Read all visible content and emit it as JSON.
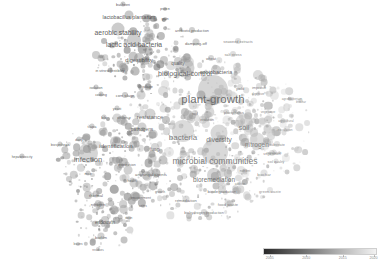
{
  "chart_data": {
    "type": "scatter",
    "title": "",
    "subtitle": "",
    "xlabel": "",
    "ylabel": "",
    "background": "#ffffff",
    "grid": false,
    "legend_position": "bottom-right",
    "overlay": {
      "kind": "colorbar",
      "scale": "grayscale",
      "dark_color": "#2a2a2a",
      "light_color": "#f2f2f2",
      "ticks": [
        "2005",
        "2010",
        "2015",
        "2020"
      ],
      "tick_positions_pct": [
        6,
        38,
        70,
        97
      ],
      "range_min": "2005",
      "range_max": "2020"
    },
    "items": [
      {
        "label": "plant-growth",
        "x": 213,
        "y": 100,
        "size": 30,
        "fs": 11.5,
        "shade": 0.5,
        "weight": 1.0
      },
      {
        "label": "microbial communities",
        "x": 215,
        "y": 161,
        "size": 26,
        "fs": 8.6,
        "shade": 0.46,
        "weight": 0.82
      },
      {
        "label": "bacteria",
        "x": 183,
        "y": 138,
        "size": 22,
        "fs": 8.0,
        "shade": 0.44,
        "weight": 0.78
      },
      {
        "label": "biological-control",
        "x": 185,
        "y": 74,
        "size": 19,
        "fs": 7.2,
        "shade": 0.55,
        "weight": 0.7
      },
      {
        "label": "diversity",
        "x": 219,
        "y": 139,
        "size": 17,
        "fs": 7.0,
        "shade": 0.48,
        "weight": 0.68
      },
      {
        "label": "soil",
        "x": 244,
        "y": 128,
        "size": 17,
        "fs": 7.2,
        "shade": 0.42,
        "weight": 0.68
      },
      {
        "label": "nitrogen",
        "x": 257,
        "y": 145,
        "size": 15,
        "fs": 6.6,
        "shade": 0.4,
        "weight": 0.64
      },
      {
        "label": "infection",
        "x": 88,
        "y": 160,
        "size": 20,
        "fs": 7.6,
        "shade": 0.52,
        "weight": 0.72
      },
      {
        "label": "lactic acid bacteria",
        "x": 134,
        "y": 45,
        "size": 14,
        "fs": 6.8,
        "shade": 0.6,
        "weight": 0.64
      },
      {
        "label": "aerobic stability",
        "x": 118,
        "y": 33,
        "size": 13,
        "fs": 6.8,
        "shade": 0.62,
        "weight": 0.62
      },
      {
        "label": "bioremediation",
        "x": 214,
        "y": 180,
        "size": 14,
        "fs": 6.4,
        "shade": 0.5,
        "weight": 0.6
      },
      {
        "label": "identification",
        "x": 116,
        "y": 146,
        "size": 12,
        "fs": 6.0,
        "shade": 0.58,
        "weight": 0.56
      },
      {
        "label": "lactobacillus plantarum",
        "x": 129,
        "y": 18,
        "size": 9,
        "fs": 5.2,
        "shade": 0.66,
        "weight": 0.46
      },
      {
        "label": "resistance",
        "x": 150,
        "y": 118,
        "size": 11,
        "fs": 5.8,
        "shade": 0.54,
        "weight": 0.52
      },
      {
        "label": "digestibility",
        "x": 139,
        "y": 61,
        "size": 10,
        "fs": 5.6,
        "shade": 0.64,
        "weight": 0.5
      },
      {
        "label": "azotobacteria",
        "x": 216,
        "y": 73,
        "size": 10,
        "fs": 5.4,
        "shade": 0.58,
        "weight": 0.48
      },
      {
        "label": "quality",
        "x": 178,
        "y": 64,
        "size": 8,
        "fs": 4.6,
        "shade": 0.56,
        "weight": 0.42
      },
      {
        "label": "pathogens",
        "x": 142,
        "y": 130,
        "size": 9,
        "fs": 4.8,
        "shade": 0.56,
        "weight": 0.44
      },
      {
        "label": "fungi",
        "x": 155,
        "y": 150,
        "size": 8,
        "fs": 4.6,
        "shade": 0.5,
        "weight": 0.42
      },
      {
        "label": "biodegradation",
        "x": 222,
        "y": 192,
        "size": 8,
        "fs": 4.4,
        "shade": 0.48,
        "weight": 0.4
      },
      {
        "label": "remediation",
        "x": 186,
        "y": 201,
        "size": 7,
        "fs": 4.2,
        "shade": 0.46,
        "weight": 0.38
      },
      {
        "label": "food waste",
        "x": 228,
        "y": 205,
        "size": 7,
        "fs": 4.2,
        "shade": 0.4,
        "weight": 0.38
      },
      {
        "label": "biohydrogen production",
        "x": 204,
        "y": 214,
        "size": 6,
        "fs": 3.8,
        "shade": 0.44,
        "weight": 0.34
      },
      {
        "label": "antifungal agents",
        "x": 151,
        "y": 175,
        "size": 7,
        "fs": 4.2,
        "shade": 0.52,
        "weight": 0.38
      },
      {
        "label": "endotoxin",
        "x": 105,
        "y": 223,
        "size": 8,
        "fs": 4.6,
        "shade": 0.6,
        "weight": 0.4
      },
      {
        "label": "biofilm",
        "x": 101,
        "y": 238,
        "size": 7,
        "fs": 4.2,
        "shade": 0.54,
        "weight": 0.38
      },
      {
        "label": "thermal",
        "x": 96,
        "y": 196,
        "size": 7,
        "fs": 4.2,
        "shade": 0.58,
        "weight": 0.38
      },
      {
        "label": "nitrogen",
        "x": 98,
        "y": 205,
        "size": 6,
        "fs": 4.0,
        "shade": 0.56,
        "weight": 0.34
      },
      {
        "label": "biochar",
        "x": 264,
        "y": 175,
        "size": 7,
        "fs": 4.2,
        "shade": 0.34,
        "weight": 0.38
      },
      {
        "label": "green waste",
        "x": 270,
        "y": 192,
        "size": 6,
        "fs": 4.0,
        "shade": 0.32,
        "weight": 0.34
      },
      {
        "label": "substrate",
        "x": 277,
        "y": 146,
        "size": 6,
        "fs": 3.8,
        "shade": 0.36,
        "weight": 0.34
      },
      {
        "label": "vegetation",
        "x": 272,
        "y": 155,
        "size": 6,
        "fs": 3.8,
        "shade": 0.36,
        "weight": 0.34
      },
      {
        "label": "soil quality",
        "x": 276,
        "y": 163,
        "size": 5,
        "fs": 3.6,
        "shade": 0.34,
        "weight": 0.3
      },
      {
        "label": "antibiotic production",
        "x": 192,
        "y": 32,
        "size": 6,
        "fs": 3.8,
        "shade": 0.58,
        "weight": 0.34
      },
      {
        "label": "damping-off",
        "x": 196,
        "y": 44,
        "size": 7,
        "fs": 4.2,
        "shade": 0.56,
        "weight": 0.36
      },
      {
        "label": "seaweed extracts",
        "x": 238,
        "y": 43,
        "size": 6,
        "fs": 3.8,
        "shade": 0.4,
        "weight": 0.32
      },
      {
        "label": "salt stress",
        "x": 233,
        "y": 56,
        "size": 6,
        "fs": 3.8,
        "shade": 0.4,
        "weight": 0.32
      },
      {
        "label": "wheat",
        "x": 211,
        "y": 60,
        "size": 6,
        "fs": 3.8,
        "shade": 0.5,
        "weight": 0.32
      },
      {
        "label": "yield",
        "x": 240,
        "y": 89,
        "size": 6,
        "fs": 4.0,
        "shade": 0.42,
        "weight": 0.34
      },
      {
        "label": "improve",
        "x": 259,
        "y": 88,
        "size": 6,
        "fs": 4.0,
        "shade": 0.38,
        "weight": 0.34
      },
      {
        "label": "in vitro digestibility",
        "x": 110,
        "y": 72,
        "size": 5,
        "fs": 3.6,
        "shade": 0.62,
        "weight": 0.3
      },
      {
        "label": "isolation",
        "x": 96,
        "y": 89,
        "size": 5,
        "fs": 3.6,
        "shade": 0.6,
        "weight": 0.3
      },
      {
        "label": "silage",
        "x": 148,
        "y": 88,
        "size": 6,
        "fs": 3.8,
        "shade": 0.6,
        "weight": 0.32
      },
      {
        "label": "corn silage",
        "x": 125,
        "y": 97,
        "size": 6,
        "fs": 3.8,
        "shade": 0.62,
        "weight": 0.32
      },
      {
        "label": "cooking",
        "x": 101,
        "y": 96,
        "size": 5,
        "fs": 3.4,
        "shade": 0.64,
        "weight": 0.28
      },
      {
        "label": "yeast",
        "x": 117,
        "y": 110,
        "size": 5,
        "fs": 3.6,
        "shade": 0.58,
        "weight": 0.3
      },
      {
        "label": "bile",
        "x": 104,
        "y": 119,
        "size": 5,
        "fs": 3.6,
        "shade": 0.58,
        "weight": 0.3
      },
      {
        "label": "virulence",
        "x": 124,
        "y": 119,
        "size": 5,
        "fs": 3.4,
        "shade": 0.56,
        "weight": 0.28
      },
      {
        "label": "tilapia",
        "x": 92,
        "y": 128,
        "size": 5,
        "fs": 3.4,
        "shade": 0.58,
        "weight": 0.28
      },
      {
        "label": "dairy",
        "x": 79,
        "y": 141,
        "size": 5,
        "fs": 3.4,
        "shade": 0.6,
        "weight": 0.28
      },
      {
        "label": "biosynthesis",
        "x": 60,
        "y": 146,
        "size": 5,
        "fs": 3.4,
        "shade": 0.58,
        "weight": 0.28
      },
      {
        "label": "hepatotoxicity",
        "x": 22,
        "y": 158,
        "size": 5,
        "fs": 3.4,
        "shade": 0.62,
        "weight": 0.28
      },
      {
        "label": "expression",
        "x": 127,
        "y": 166,
        "size": 5,
        "fs": 3.6,
        "shade": 0.54,
        "weight": 0.3
      },
      {
        "label": "mice",
        "x": 88,
        "y": 175,
        "size": 5,
        "fs": 3.4,
        "shade": 0.56,
        "weight": 0.28
      },
      {
        "label": "health",
        "x": 132,
        "y": 182,
        "size": 5,
        "fs": 3.4,
        "shade": 0.54,
        "weight": 0.28
      },
      {
        "label": "environment",
        "x": 141,
        "y": 199,
        "size": 5,
        "fs": 3.6,
        "shade": 0.52,
        "weight": 0.3
      },
      {
        "label": "users",
        "x": 143,
        "y": 207,
        "size": 4,
        "fs": 3.2,
        "shade": 0.52,
        "weight": 0.26
      },
      {
        "label": "growth",
        "x": 160,
        "y": 193,
        "size": 5,
        "fs": 3.4,
        "shade": 0.5,
        "weight": 0.28
      },
      {
        "label": "protein",
        "x": 165,
        "y": 10,
        "size": 4,
        "fs": 3.2,
        "shade": 0.66,
        "weight": 0.26
      },
      {
        "label": "buchneri",
        "x": 123,
        "y": 6,
        "size": 5,
        "fs": 3.6,
        "shade": 0.68,
        "weight": 0.28
      },
      {
        "label": "grain",
        "x": 165,
        "y": 20,
        "size": 4,
        "fs": 3.2,
        "shade": 0.64,
        "weight": 0.26
      },
      {
        "label": "soil",
        "x": 195,
        "y": 115,
        "size": 6,
        "fs": 3.8,
        "shade": 0.46,
        "weight": 0.32
      },
      {
        "label": "phosphorus",
        "x": 234,
        "y": 114,
        "size": 6,
        "fs": 3.8,
        "shade": 0.38,
        "weight": 0.32
      },
      {
        "label": "evolution",
        "x": 207,
        "y": 121,
        "size": 5,
        "fs": 3.4,
        "shade": 0.48,
        "weight": 0.28
      },
      {
        "label": "regulation",
        "x": 274,
        "y": 154,
        "size": 5,
        "fs": 3.4,
        "shade": 0.34,
        "weight": 0.28
      },
      {
        "label": "digestive",
        "x": 258,
        "y": 95,
        "size": 4,
        "fs": 3.2,
        "shade": 0.4,
        "weight": 0.26
      },
      {
        "label": "agrobacterium",
        "x": 292,
        "y": 100,
        "size": 4,
        "fs": 3.2,
        "shade": 0.34,
        "weight": 0.26
      },
      {
        "label": "vegetative",
        "x": 268,
        "y": 113,
        "size": 4,
        "fs": 3.2,
        "shade": 0.34,
        "weight": 0.26
      },
      {
        "label": "agricultural",
        "x": 286,
        "y": 122,
        "size": 4,
        "fs": 3.2,
        "shade": 0.32,
        "weight": 0.26
      },
      {
        "label": "inoculation",
        "x": 285,
        "y": 131,
        "size": 4,
        "fs": 3.2,
        "shade": 0.32,
        "weight": 0.26
      },
      {
        "label": "biochar",
        "x": 301,
        "y": 102,
        "size": 4,
        "fs": 3.0,
        "shade": 0.32,
        "weight": 0.24
      },
      {
        "label": "nutrient",
        "x": 245,
        "y": 172,
        "size": 4,
        "fs": 3.2,
        "shade": 0.38,
        "weight": 0.26
      },
      {
        "label": "addition",
        "x": 240,
        "y": 184,
        "size": 4,
        "fs": 3.0,
        "shade": 0.38,
        "weight": 0.24
      },
      {
        "label": "toxin",
        "x": 129,
        "y": 219,
        "size": 4,
        "fs": 3.2,
        "shade": 0.56,
        "weight": 0.26
      },
      {
        "label": "leaves",
        "x": 78,
        "y": 245,
        "size": 4,
        "fs": 3.2,
        "shade": 0.56,
        "weight": 0.26
      },
      {
        "label": "residues",
        "x": 98,
        "y": 250,
        "size": 4,
        "fs": 3.0,
        "shade": 0.54,
        "weight": 0.24
      }
    ],
    "cluster_seeds": [
      {
        "cx": 205,
        "cy": 118,
        "rx": 78,
        "ry": 60,
        "n": 300,
        "shade": 0.42,
        "smax": 9
      },
      {
        "cx": 110,
        "cy": 165,
        "rx": 52,
        "ry": 48,
        "n": 230,
        "shade": 0.56,
        "smax": 8
      },
      {
        "cx": 145,
        "cy": 55,
        "rx": 50,
        "ry": 40,
        "n": 150,
        "shade": 0.62,
        "smax": 8
      },
      {
        "cx": 255,
        "cy": 130,
        "rx": 58,
        "ry": 55,
        "n": 170,
        "shade": 0.34,
        "smax": 7
      },
      {
        "cx": 205,
        "cy": 190,
        "rx": 60,
        "ry": 32,
        "n": 120,
        "shade": 0.46,
        "smax": 7
      },
      {
        "cx": 105,
        "cy": 225,
        "rx": 30,
        "ry": 26,
        "n": 70,
        "shade": 0.56,
        "smax": 6
      }
    ]
  }
}
